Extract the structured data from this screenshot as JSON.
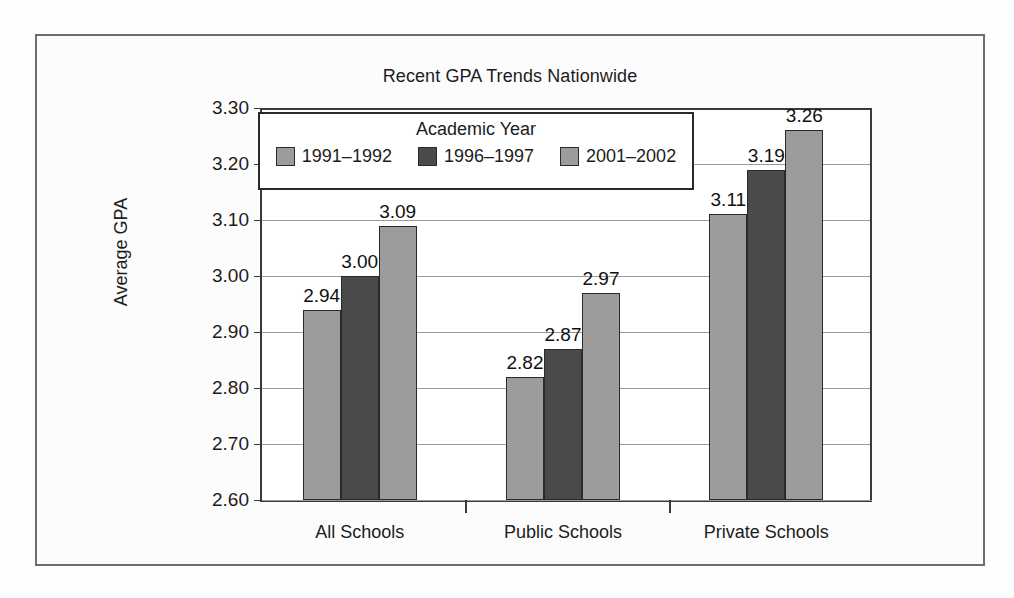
{
  "scan_artifact_text": "",
  "chart_data": {
    "type": "bar",
    "title": "Recent GPA Trends Nationwide",
    "xlabel": "",
    "ylabel": "Average GPA",
    "categories": [
      "All Schools",
      "Public Schools",
      "Private Schools"
    ],
    "series": [
      {
        "name": "1991–1992",
        "values": [
          2.94,
          2.82,
          3.11
        ],
        "color": "#9c9c9c"
      },
      {
        "name": "1996–1997",
        "values": [
          3.0,
          2.87,
          3.19
        ],
        "color": "#4a4a4a"
      },
      {
        "name": "2001–2002",
        "values": [
          3.09,
          2.97,
          3.26
        ],
        "color": "#9c9c9c"
      }
    ],
    "value_labels": [
      [
        "2.94",
        "3.00",
        "3.09"
      ],
      [
        "2.82",
        "2.87",
        "2.97"
      ],
      [
        "3.11",
        "3.19",
        "3.26"
      ]
    ],
    "ylim": [
      2.6,
      3.3
    ],
    "ytick_labels": [
      "3.30",
      "3.20",
      "3.10",
      "3.00",
      "2.90",
      "2.80",
      "2.70",
      "2.60"
    ],
    "ytick_values": [
      3.3,
      3.2,
      3.1,
      3.0,
      2.9,
      2.8,
      2.7,
      2.6
    ],
    "grid": true,
    "legend": {
      "title": "Academic Year",
      "position": "inside-top-left"
    }
  }
}
